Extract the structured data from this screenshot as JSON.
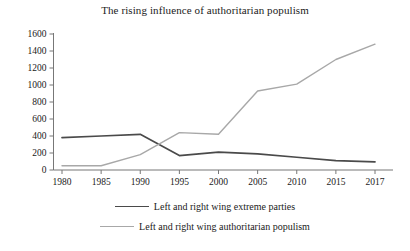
{
  "chart_data": {
    "type": "line",
    "title": "The rising influence of authoritarian populism",
    "xlabel": "",
    "ylabel": "",
    "x": [
      1980,
      1985,
      1990,
      1995,
      2000,
      2005,
      2010,
      2015,
      2017
    ],
    "categories": [
      "1980",
      "1985",
      "1990",
      "1995",
      "2000",
      "2005",
      "2010",
      "2015",
      "2017"
    ],
    "series": [
      {
        "name": "Left and right wing extreme parties",
        "color": "#4a4a4a",
        "values": [
          380,
          400,
          420,
          170,
          210,
          190,
          150,
          110,
          95
        ]
      },
      {
        "name": "Left and right wing authoritarian populism",
        "color": "#a8a8a8",
        "values": [
          50,
          50,
          180,
          440,
          420,
          930,
          1010,
          1300,
          1480
        ]
      }
    ],
    "ylim": [
      0,
      1600
    ],
    "yticks": [
      0,
      200,
      400,
      600,
      800,
      1000,
      1200,
      1400,
      1600
    ],
    "ytick_labels": [
      "0",
      "200",
      "400",
      "600",
      "800",
      "1000",
      "1200",
      "1400",
      "1600"
    ],
    "xlim": [
      1980,
      2017
    ],
    "grid": false,
    "legend_position": "bottom"
  },
  "legend": {
    "entries": [
      {
        "label": "Left and right wing extreme parties",
        "color": "#4a4a4a"
      },
      {
        "label": "Left and right wing authoritarian populism",
        "color": "#a8a8a8"
      }
    ]
  }
}
